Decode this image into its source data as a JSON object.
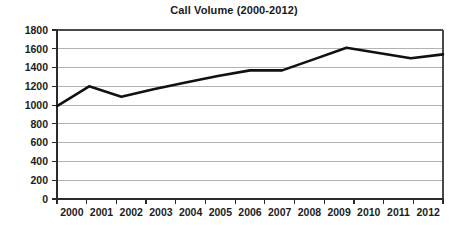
{
  "chart_data": {
    "type": "line",
    "title": "Call Volume (2000-2012)",
    "xlabel": "",
    "ylabel": "",
    "categories": [
      "2000",
      "2001",
      "2002",
      "2003",
      "2004",
      "2005",
      "2006",
      "2007",
      "2008",
      "2009",
      "2010",
      "2011",
      "2012"
    ],
    "values": [
      990,
      1200,
      1090,
      1170,
      1240,
      1310,
      1370,
      1370,
      1490,
      1610,
      1555,
      1500,
      1540
    ],
    "series": [
      {
        "name": "Call Volume",
        "values": [
          990,
          1200,
          1090,
          1170,
          1240,
          1310,
          1370,
          1370,
          1490,
          1610,
          1555,
          1500,
          1540
        ]
      }
    ],
    "ylim": [
      0,
      1800
    ],
    "ytick_labels": [
      "1800",
      "1600",
      "1400",
      "1200",
      "1000",
      "800",
      "600",
      "400",
      "200",
      "0"
    ],
    "ytick_values": [
      1800,
      1600,
      1400,
      1200,
      1000,
      800,
      600,
      400,
      200,
      0
    ],
    "xtick_labels": [
      "2000",
      "2001",
      "2002",
      "2003",
      "2004",
      "2005",
      "2006",
      "2007",
      "2008",
      "2009",
      "2010",
      "2011",
      "2012"
    ],
    "grid": true,
    "grid_axis": "y",
    "legend": false,
    "legend_position": "none",
    "line_color": "#111111",
    "grid_color": "#b2b2b2",
    "axis_color": "#2b2b2b",
    "text_color": "#1c1c1c",
    "background": "#ffffff"
  },
  "layout": {
    "plot_left": 57,
    "plot_right": 443,
    "plot_top": 30,
    "plot_bottom": 199
  }
}
